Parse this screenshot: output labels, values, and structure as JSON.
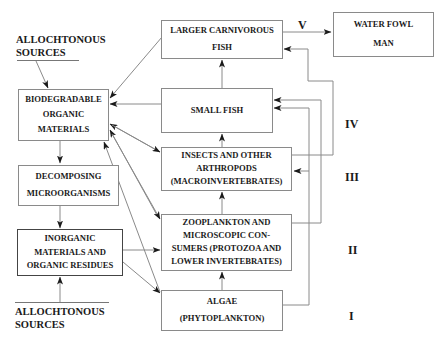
{
  "diagram": {
    "type": "aquatic food web / trophic levels",
    "sources_top": {
      "line1": "ALLOCHTONOUS",
      "line2": "SOURCES"
    },
    "sources_bottom": {
      "line1": "ALLOCHTONOUS",
      "line2": "SOURCES"
    },
    "left_column": [
      {
        "id": "biodegradable",
        "lines": [
          "BIODEGRADABLE",
          "ORGANIC",
          "MATERIALS"
        ]
      },
      {
        "id": "decomposing",
        "lines": [
          "DECOMPOSING",
          "MICROORGANISMS"
        ]
      },
      {
        "id": "inorganic",
        "lines": [
          "INORGANIC",
          "MATERIALS AND",
          "ORGANIC RESIDUES"
        ]
      }
    ],
    "center_column": [
      {
        "id": "larger-fish",
        "lines": [
          "LARGER CARNIVOROUS",
          "FISH"
        ]
      },
      {
        "id": "small-fish",
        "lines": [
          "SMALL  FISH"
        ]
      },
      {
        "id": "insects",
        "lines": [
          "INSECTS AND OTHER",
          "ARTHROPODS",
          "(MACROINVERTEBRATES)"
        ]
      },
      {
        "id": "zooplankton",
        "lines": [
          "ZOOPLANKTON AND",
          "MICROSCOPIC  CON-",
          "SUMERS (PROTOZOA AND",
          "LOWER INVERTEBRATES)"
        ]
      },
      {
        "id": "algae",
        "lines": [
          "ALGAE",
          "(PHYTOPLANKTON)"
        ]
      }
    ],
    "top_consumer": {
      "id": "water-fowl-man",
      "lines": [
        "WATER FOWL",
        "MAN"
      ]
    },
    "trophic_levels": [
      "V",
      "IV",
      "III",
      "II",
      "I"
    ],
    "colors": {
      "line": "#8a8a8a",
      "arrow": "#1a1a1a",
      "text": "#1a1a1a",
      "background": "#ffffff"
    }
  }
}
